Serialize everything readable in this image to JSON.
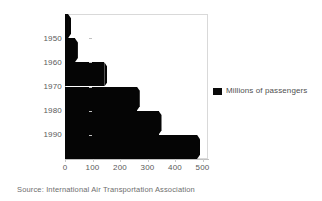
{
  "chart_data": {
    "type": "bar",
    "orientation": "horizontal",
    "title": "",
    "subtitle": "",
    "xlabel": "",
    "ylabel": "",
    "categories": [
      "1945",
      "1950",
      "1960",
      "1970",
      "1980",
      "1990"
    ],
    "values": [
      11,
      36,
      143,
      261,
      340,
      480
    ],
    "series": [
      {
        "name": "Millions of passengers",
        "color": "#000000",
        "values": [
          11,
          36,
          143,
          261,
          340,
          480
        ]
      }
    ],
    "xlim": [
      0,
      520
    ],
    "ylim": [
      0,
      6
    ],
    "xticks": [
      0,
      100,
      200,
      300,
      400,
      500
    ],
    "xtick_labels": [
      "0",
      "100",
      "200",
      "300",
      "400",
      "500"
    ],
    "yticks": [
      1950,
      1960,
      1970,
      1980,
      1990
    ],
    "ytick_labels": [
      "1950",
      "1960",
      "1970",
      "1980",
      "1990"
    ],
    "grid": false,
    "legend_position": "right",
    "legend_entries": [
      "Millions of passengers"
    ]
  },
  "legend": {
    "label": "Millions of passengers",
    "swatch_color": "#000000"
  },
  "footer": {
    "source": "Source: International Air Transportation Association"
  },
  "axis": {
    "tick_color": "#c2c2c2",
    "label_color": "#5a5a5a",
    "frame_color": "#d9d9d9"
  },
  "ytick_labels_rendered": [
    "1950",
    "1960",
    "1970",
    "1980",
    "1990"
  ],
  "xtick_labels_rendered": [
    "0",
    "100",
    "200",
    "300",
    "400",
    "500"
  ]
}
